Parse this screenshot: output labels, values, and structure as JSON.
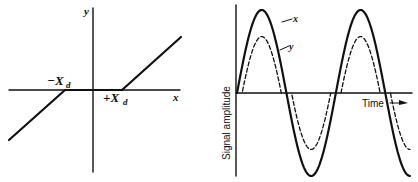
{
  "left_panel": {
    "title": "Dead-zone nonlinearity transfer characteristic",
    "x_axis_label": "x",
    "y_axis_label": "y",
    "neg_threshold_label_main": "−X",
    "neg_threshold_label_sub": "d",
    "pos_threshold_label_main": "+X",
    "pos_threshold_label_sub": "d",
    "dead_zone": {
      "lower": -1,
      "upper": 1
    },
    "slope": 1
  },
  "right_panel": {
    "title": "Sinusoidal input and dead-zone output",
    "y_axis_label": "Signal amplitude",
    "x_axis_label": "Time",
    "curve_labels": {
      "input": "x",
      "output": "y"
    },
    "input_signal": {
      "name": "x",
      "style": "solid",
      "amplitude": 1.0,
      "cycles": 1.75
    },
    "output_signal": {
      "name": "y",
      "style": "dashed",
      "amplitude": 0.68,
      "dead_zone_fraction": 0.32
    }
  }
}
